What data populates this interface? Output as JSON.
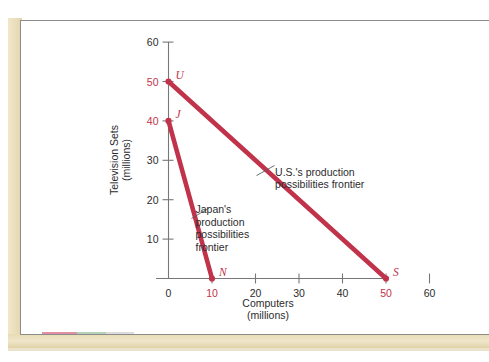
{
  "figure": {
    "background_color": "#ffffff",
    "panel_border_color": "#8c8c8c",
    "edge_strip_color": "#ebdfbd"
  },
  "chart_data": {
    "type": "line",
    "title": "",
    "xlabel": "Computers",
    "xlabel_sub": "(millions)",
    "ylabel": "Television Sets",
    "ylabel_sub": "(millions)",
    "xlim": [
      0,
      65
    ],
    "ylim": [
      0,
      66
    ],
    "grid": false,
    "legend": "none",
    "accent_color": "#c0334a",
    "axis_color": "#77777a",
    "x_ticks": [
      {
        "value": 0,
        "label": "0",
        "highlight": false
      },
      {
        "value": 10,
        "label": "10",
        "highlight": true
      },
      {
        "value": 20,
        "label": "20",
        "highlight": false
      },
      {
        "value": 30,
        "label": "30",
        "highlight": false
      },
      {
        "value": 40,
        "label": "40",
        "highlight": false
      },
      {
        "value": 50,
        "label": "50",
        "highlight": true
      },
      {
        "value": 60,
        "label": "60",
        "highlight": false
      }
    ],
    "y_ticks": [
      {
        "value": 10,
        "label": "10",
        "highlight": false
      },
      {
        "value": 20,
        "label": "20",
        "highlight": false
      },
      {
        "value": 30,
        "label": "30",
        "highlight": false
      },
      {
        "value": 40,
        "label": "40",
        "highlight": true
      },
      {
        "value": 50,
        "label": "50",
        "highlight": true
      },
      {
        "value": 60,
        "label": "60",
        "highlight": false
      }
    ],
    "series": [
      {
        "name": "U.S.'s production possibilities frontier",
        "color": "#c0334a",
        "x": [
          0,
          50
        ],
        "y": [
          50,
          0
        ],
        "endpoints": [
          {
            "label": "U",
            "x": 0,
            "y": 50
          },
          {
            "label": "S",
            "x": 50,
            "y": 0
          }
        ]
      },
      {
        "name": "Japan's production possibilities frontier",
        "color": "#c0334a",
        "x": [
          0,
          10
        ],
        "y": [
          40,
          0
        ],
        "endpoints": [
          {
            "label": "J",
            "x": 0,
            "y": 40
          },
          {
            "label": "N",
            "x": 10,
            "y": 0
          }
        ]
      }
    ],
    "annotations": [
      {
        "id": "us-annotation",
        "lines": [
          "U.S.'s production",
          "possibilities frontier"
        ],
        "anchor_x": 24.5,
        "anchor_y": 26
      },
      {
        "id": "japan-annotation",
        "lines": [
          "Japan's",
          "production",
          "possibilities",
          "frontier"
        ],
        "anchor_x": 6.2,
        "anchor_y": 16.5
      }
    ]
  }
}
